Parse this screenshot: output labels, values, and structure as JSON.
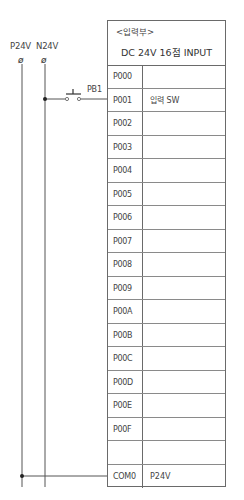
{
  "rails": {
    "positive": {
      "label": "P24V",
      "terminal": "ø"
    },
    "negative": {
      "label": "N24V",
      "terminal": "ø"
    }
  },
  "switch": {
    "label": "PB1",
    "type": "push-button-NO"
  },
  "module": {
    "section_label": "<입력부>",
    "title": "DC 24V 16점 INPUT",
    "rows": [
      {
        "address": "P000",
        "description": ""
      },
      {
        "address": "P001",
        "description": "입력 SW"
      },
      {
        "address": "P002",
        "description": ""
      },
      {
        "address": "P003",
        "description": ""
      },
      {
        "address": "P004",
        "description": ""
      },
      {
        "address": "P005",
        "description": ""
      },
      {
        "address": "P006",
        "description": ""
      },
      {
        "address": "P007",
        "description": ""
      },
      {
        "address": "P008",
        "description": ""
      },
      {
        "address": "P009",
        "description": ""
      },
      {
        "address": "P00A",
        "description": ""
      },
      {
        "address": "P00B",
        "description": ""
      },
      {
        "address": "P00C",
        "description": ""
      },
      {
        "address": "P00D",
        "description": ""
      },
      {
        "address": "P00E",
        "description": ""
      },
      {
        "address": "P00F",
        "description": ""
      },
      {
        "address": "",
        "description": ""
      },
      {
        "address": "COM0",
        "description": "P24V"
      }
    ]
  },
  "colors": {
    "line": "#555555",
    "border": "#6a6a6a",
    "text": "#444444"
  }
}
